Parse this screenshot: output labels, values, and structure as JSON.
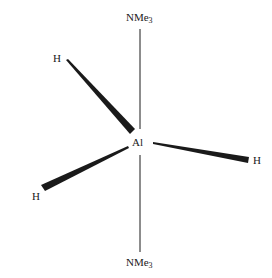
{
  "diagram": {
    "title": "",
    "center_atom": "Al",
    "axial_ligands": [
      {
        "position": "top",
        "label_main": "NMe",
        "label_sub": "3"
      },
      {
        "position": "bottom",
        "label_main": "NMe",
        "label_sub": "3"
      }
    ],
    "equatorial_ligands": [
      {
        "position": "upper-left",
        "label": "H",
        "bond": "wedge"
      },
      {
        "position": "right",
        "label": "H",
        "bond": "wedge"
      },
      {
        "position": "lower-left",
        "label": "H",
        "bond": "wedge"
      }
    ],
    "colors": {
      "ink": "#1a1a1a",
      "background": "#ffffff"
    }
  }
}
